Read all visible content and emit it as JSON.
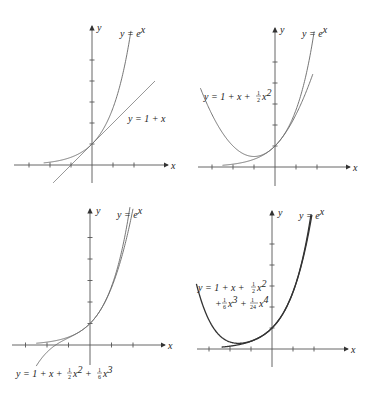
{
  "chart_data": [
    {
      "type": "line",
      "panel": "top-left",
      "title": "",
      "xlabel": "x",
      "ylabel": "y",
      "xlim": [
        -2.4,
        2.9
      ],
      "ylim": [
        -0.9,
        6.6
      ],
      "grid": false,
      "x_ticks": [
        -3,
        -2,
        -1,
        1,
        2
      ],
      "y_ticks": [
        1,
        2,
        3,
        4,
        5
      ],
      "series": [
        {
          "name": "y = e^x",
          "label": "y = e",
          "sup": "x",
          "expr": "exp",
          "xrange": [
            -2.3,
            2.05
          ]
        },
        {
          "name": "y = 1 + x",
          "label": "y = 1 + x",
          "expr": "taylor1",
          "xrange": [
            -1.85,
            3.0
          ]
        }
      ]
    },
    {
      "type": "line",
      "panel": "top-right",
      "xlabel": "x",
      "ylabel": "y",
      "x_ticks": [
        -3,
        -2,
        -1,
        1,
        2
      ],
      "y_ticks": [
        1,
        2,
        3,
        4,
        5
      ],
      "grid": false,
      "series": [
        {
          "name": "y = e^x",
          "label": "y = e",
          "sup": "x",
          "expr": "exp",
          "xrange": [
            -2.5,
            2.35
          ]
        },
        {
          "name": "y = 1 + x + (1/2)x^2",
          "label": "y = 1 + x + ½x²",
          "expr": "taylor2",
          "xrange": [
            -3.55,
            1.8
          ]
        }
      ]
    },
    {
      "type": "line",
      "panel": "bottom-left",
      "xlabel": "x",
      "ylabel": "y",
      "x_ticks": [
        -3,
        -2,
        -1,
        1,
        2
      ],
      "y_ticks": [
        1,
        2,
        3,
        4,
        5
      ],
      "grid": false,
      "series": [
        {
          "name": "y = e^x",
          "label": "y = e",
          "sup": "x",
          "expr": "exp",
          "xrange": [
            -2.5,
            1.97
          ]
        },
        {
          "name": "y = 1 + x + (1/2)x^2 + (1/6)x^3",
          "label": "y = 1 + x + ½x² + ⅙x³",
          "expr": "taylor3",
          "xrange": [
            -2.5,
            2.0
          ]
        }
      ]
    },
    {
      "type": "line",
      "panel": "bottom-right",
      "xlabel": "x",
      "ylabel": "y",
      "x_ticks": [
        -3,
        -2,
        -1,
        1,
        2
      ],
      "y_ticks": [
        1,
        2,
        3,
        4,
        5
      ],
      "grid": false,
      "series": [
        {
          "name": "y = e^x",
          "label": "y = e",
          "sup": "x",
          "expr": "exp",
          "xrange": [
            -2.4,
            1.9
          ]
        },
        {
          "name": "y = 1 + x + (1/2)x^2 + (1/6)x^3 + (1/24)x^4",
          "label": "y = 1 + x + ½x² + ⅙x³ + (1/24)x⁴",
          "expr": "taylor4",
          "xrange": [
            -3.6,
            1.9
          ]
        }
      ]
    }
  ],
  "labels": {
    "axis_x": "x",
    "axis_y": "y",
    "p1": {
      "ex": "y = e",
      "ex_sup": "x",
      "line": "y = 1 + x"
    },
    "p2": {
      "ex": "y = e",
      "ex_sup": "x",
      "poly_a": "y = 1 + x + ",
      "poly_b": "x",
      "poly_b_sup": "2",
      "half_num": "1",
      "half_den": "2"
    },
    "p3": {
      "ex": "y = e",
      "ex_sup": "x",
      "poly_a": "y = 1 + x + ",
      "x2": "x",
      "x2_sup": "2",
      "plus": " + ",
      "x3": "x",
      "x3_sup": "3",
      "half_num": "1",
      "half_den": "2",
      "sixth_num": "1",
      "sixth_den": "6"
    },
    "p4": {
      "ex": "y = e",
      "ex_sup": "x",
      "poly_a": "y = 1 + x + ",
      "x2": "x",
      "x2_sup": "2",
      "plus_a": "+ ",
      "x3": "x",
      "x3_sup": "3",
      "plus_b": " + ",
      "x4": "x",
      "x4_sup": "4",
      "half_num": "1",
      "half_den": "2",
      "sixth_num": "1",
      "sixth_den": "6",
      "tf_num": "1",
      "tf_den": "24"
    }
  }
}
